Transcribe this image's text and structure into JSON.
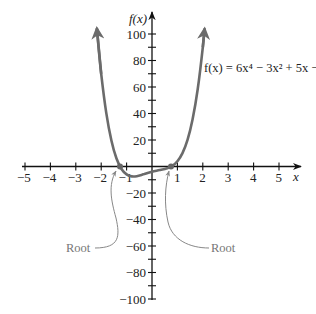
{
  "chart_data": {
    "type": "line",
    "title": "",
    "function_label": "f(x) = 6x⁴ − 3x² + 5x − 4",
    "xlabel": "x",
    "ylabel": "f(x)",
    "xlim": [
      -5,
      5
    ],
    "ylim": [
      -100,
      100
    ],
    "x_ticks": [
      -5,
      -4,
      -3,
      -2,
      -1,
      1,
      2,
      3,
      4,
      5
    ],
    "y_ticks_labeled": [
      100,
      80,
      60,
      40,
      20,
      -20,
      -40,
      -60,
      -80,
      -100
    ],
    "y_tick_step": 10,
    "grid": false,
    "series": [
      {
        "name": "f(x) = 6x^4 - 3x^2 + 5x - 4",
        "color": "#6b6b6b",
        "x": [
          -2.17,
          -2.0,
          -1.8,
          -1.6,
          -1.4,
          -1.2,
          -1.0,
          -0.8,
          -0.6,
          -0.3,
          0.0,
          0.3,
          0.6,
          0.8,
          1.0,
          1.2,
          1.4,
          1.6,
          1.8,
          2.0,
          2.07
        ],
        "y": [
          104,
          70,
          40.3,
          19.6,
          6.2,
          -1.9,
          -6,
          -7.5,
          -7.3,
          -5.7,
          -4,
          -2.7,
          -1.3,
          0.5,
          4,
          10.1,
          20.2,
          35.6,
          58.3,
          90,
          103.7
        ]
      }
    ],
    "annotations": [
      {
        "text": "Root",
        "x": -1.25,
        "y": 0
      },
      {
        "text": "Root",
        "x": 0.77,
        "y": 0
      }
    ]
  },
  "labels": {
    "x_axis": "x",
    "y_axis": "f(x)",
    "equation": "f(x) = 6x⁴ − 3x² + 5x − 4",
    "root_left": "Root",
    "root_right": "Root"
  }
}
